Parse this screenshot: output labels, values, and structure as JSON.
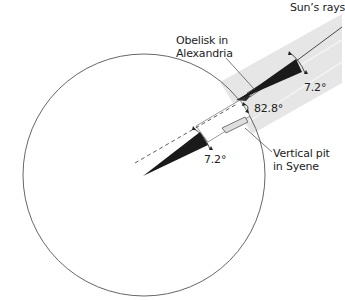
{
  "diagram": {
    "type": "geometric illustration",
    "labels": {
      "sun_rays": "Sun’s rays",
      "obelisk_line1": "Obelisk in",
      "obelisk_line2": "Alexandria",
      "angle_top": "7.2°",
      "angle_obelisk": "82.8°",
      "pit_line1": "Vertical pit",
      "pit_line2": "in Syene",
      "angle_center": "7.2°"
    },
    "colors": {
      "band": "#e6e6e6",
      "band_lines": "#f5f5f5",
      "wedge": "#1a1a1a",
      "outline": "#444444",
      "text": "#222222"
    }
  }
}
